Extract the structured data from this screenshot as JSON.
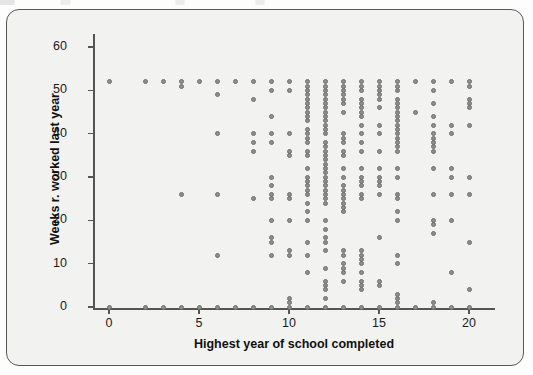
{
  "figure": {
    "background_color": "#f2f2f0",
    "frame_color": "#585858",
    "marker_color": "#8e8e8e",
    "marker_edge_color": "#6e6e6e"
  },
  "axis": {
    "x_title": "Highest year of school completed",
    "y_title": "Weeks r. worked last year",
    "x_ticks": [
      "0",
      "5",
      "10",
      "15",
      "20"
    ],
    "y_ticks": [
      "0",
      "10",
      "20",
      "30",
      "40",
      "50",
      "60"
    ]
  },
  "chart_data": {
    "type": "scatter",
    "title": "",
    "xlabel": "Highest year of school completed",
    "ylabel": "Weeks r. worked last year",
    "xlim": [
      -0.8,
      21.2
    ],
    "ylim": [
      -3,
      63
    ],
    "xticks": [
      0,
      5,
      10,
      15,
      20
    ],
    "yticks": [
      0,
      10,
      20,
      30,
      40,
      50,
      60
    ],
    "grid": false,
    "legend": null,
    "marker": "circle",
    "points_by_x": {
      "0": [
        52,
        0
      ],
      "2": [
        52,
        0
      ],
      "3": [
        52,
        0
      ],
      "4": [
        52,
        51,
        26,
        0
      ],
      "5": [
        52,
        0
      ],
      "6": [
        52,
        49,
        40,
        26,
        12,
        0
      ],
      "7": [
        52,
        0
      ],
      "8": [
        52,
        48,
        40,
        38,
        36,
        25,
        0
      ],
      "9": [
        52,
        50,
        44,
        40,
        38,
        30,
        28,
        26,
        25,
        20,
        16,
        15,
        12,
        0
      ],
      "10": [
        52,
        50,
        40,
        36,
        35,
        26,
        25,
        20,
        13,
        12,
        2,
        1,
        0
      ],
      "11": [
        52,
        51,
        50,
        49,
        48,
        47,
        46,
        45,
        44,
        43,
        41,
        40,
        39,
        38,
        36,
        35,
        32,
        30,
        29,
        28,
        27,
        26,
        24,
        22,
        20,
        15,
        12,
        8,
        0
      ],
      "12": [
        52,
        51,
        50,
        49,
        48,
        47,
        46,
        45,
        44,
        43,
        42,
        41,
        40,
        38,
        37,
        36,
        35,
        34,
        33,
        32,
        31,
        30,
        29,
        28,
        27,
        26,
        25,
        24,
        20,
        18,
        16,
        15,
        13,
        9,
        6,
        5,
        4,
        2,
        0
      ],
      "13": [
        52,
        51,
        50,
        49,
        48,
        47,
        45,
        40,
        39,
        38,
        36,
        35,
        32,
        30,
        28,
        27,
        26,
        25,
        24,
        23,
        22,
        13,
        12,
        10,
        9,
        8,
        6,
        0
      ],
      "14": [
        52,
        51,
        50,
        48,
        47,
        46,
        45,
        44,
        42,
        40,
        38,
        36,
        32,
        30,
        29,
        28,
        26,
        25,
        13,
        12,
        11,
        10,
        8,
        6,
        5,
        4,
        0
      ],
      "15": [
        52,
        51,
        50,
        49,
        48,
        46,
        42,
        40,
        36,
        32,
        30,
        29,
        28,
        26,
        16,
        6,
        5,
        0
      ],
      "16": [
        52,
        51,
        50,
        48,
        47,
        46,
        45,
        44,
        43,
        42,
        41,
        40,
        39,
        38,
        37,
        36,
        32,
        30,
        26,
        25,
        22,
        20,
        12,
        10,
        3,
        2,
        1,
        0
      ],
      "17": [
        52,
        45,
        0
      ],
      "18": [
        52,
        50,
        47,
        44,
        42,
        40,
        39,
        38,
        37,
        36,
        32,
        26,
        20,
        19,
        17,
        1,
        0
      ],
      "19": [
        52,
        42,
        40,
        32,
        30,
        26,
        20,
        8,
        0
      ],
      "20": [
        52,
        51,
        48,
        47,
        46,
        42,
        30,
        26,
        15,
        4,
        0
      ]
    }
  }
}
